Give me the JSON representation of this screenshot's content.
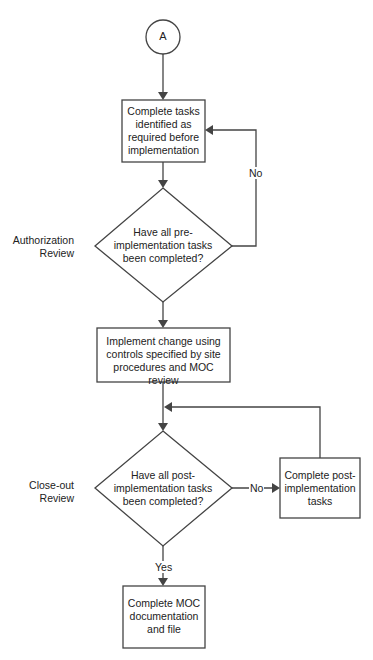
{
  "diagram": {
    "type": "flowchart",
    "colors": {
      "stroke": "#444444",
      "text": "#222222",
      "background": "#ffffff"
    },
    "connector_start": {
      "label": "A",
      "shape": "circle"
    },
    "side_labels": {
      "authorization": "Authorization\nReview",
      "closeout": "Close-out\nReview"
    },
    "nodes": {
      "pre_tasks": {
        "shape": "process",
        "label": "Complete tasks\nidentified as\nrequired before\nimplementation"
      },
      "pre_decision": {
        "shape": "decision",
        "label": "Have all pre-\nimplementation tasks\nbeen completed?"
      },
      "implement": {
        "shape": "process",
        "label": "Implement change using\ncontrols specified by site\nprocedures and MOC review"
      },
      "post_decision": {
        "shape": "decision",
        "label": "Have all post-\nimplementation tasks\nbeen completed?"
      },
      "post_tasks": {
        "shape": "process",
        "label": "Complete post-\nimplementation\ntasks"
      },
      "finish": {
        "shape": "process",
        "label": "Complete MOC\ndocumentation\nand file"
      }
    },
    "edges": {
      "pre_no": "No",
      "post_no": "No",
      "post_yes": "Yes"
    }
  }
}
